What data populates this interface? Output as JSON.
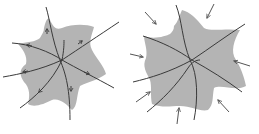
{
  "figure": {
    "description": "Two star-shaped shaded regions crossed by curves",
    "colors": {
      "region_fill": "#b4b4b4",
      "curve_stroke": "#3a3a3a",
      "arrow_stroke": "#555555",
      "background": "#ffffff"
    },
    "panels": [
      {
        "id": "left",
        "label": "outward flow along curves",
        "curve_count": 4,
        "arrowheads_on_curves": 6
      },
      {
        "id": "right",
        "label": "inward compression arrows",
        "curve_count": 4,
        "external_arrows": 8
      }
    ]
  }
}
